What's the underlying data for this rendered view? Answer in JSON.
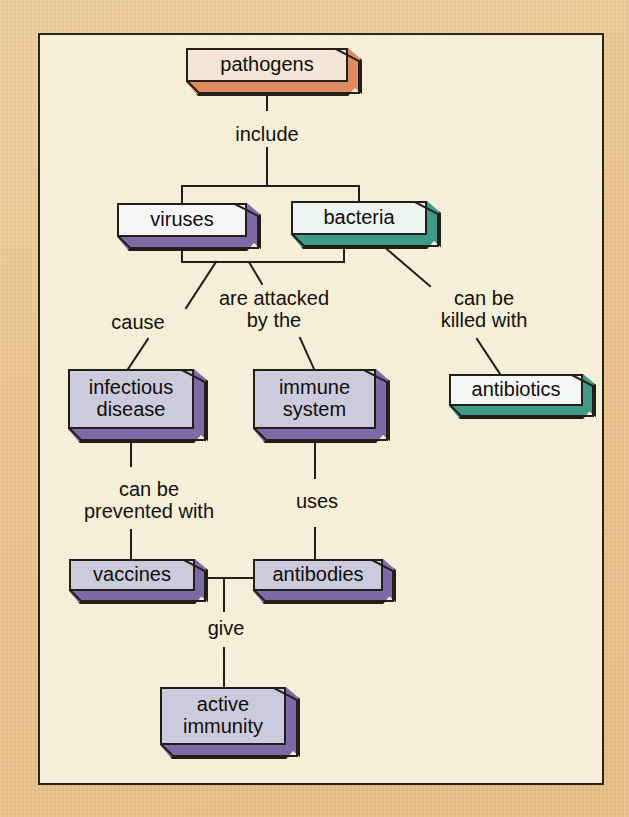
{
  "diagram": {
    "background_color": "#eec894",
    "panel_color": "#f7f1d9",
    "line_color": "#241f16"
  },
  "nodes": [
    {
      "id": "pathogens",
      "label": "pathogens",
      "x": 186,
      "y": 48,
      "w": 162,
      "h": 34,
      "depth": 12,
      "face_color": "#f3e5d8",
      "side_color": "#e08a63",
      "top_color": "#f5b494"
    },
    {
      "id": "viruses",
      "label": "viruses",
      "x": 117,
      "y": 203,
      "w": 130,
      "h": 34,
      "depth": 12,
      "face_color": "#f6f6f6",
      "side_color": "#7d6aa6",
      "top_color": "#a394c4"
    },
    {
      "id": "bacteria",
      "label": "bacteria",
      "x": 291,
      "y": 201,
      "w": 136,
      "h": 34,
      "depth": 12,
      "face_color": "#edf5f3",
      "side_color": "#3f9b88",
      "top_color": "#6dbbaa"
    },
    {
      "id": "infectious-disease",
      "label": "infectious\ndisease",
      "x": 68,
      "y": 369,
      "w": 126,
      "h": 60,
      "depth": 12,
      "face_color": "#cbcbdd",
      "side_color": "#7d6aa6",
      "top_color": "#a394c4"
    },
    {
      "id": "immune-system",
      "label": "immune\nsystem",
      "x": 253,
      "y": 369,
      "w": 123,
      "h": 60,
      "depth": 12,
      "face_color": "#cbcbdd",
      "side_color": "#7d6aa6",
      "top_color": "#a394c4"
    },
    {
      "id": "antibiotics",
      "label": "antibiotics",
      "x": 449,
      "y": 374,
      "w": 134,
      "h": 32,
      "depth": 11,
      "face_color": "#f4f7f5",
      "side_color": "#3f9b88",
      "top_color": "#6dbbaa"
    },
    {
      "id": "vaccines",
      "label": "vaccines",
      "x": 69,
      "y": 559,
      "w": 126,
      "h": 32,
      "depth": 11,
      "face_color": "#cbcbdd",
      "side_color": "#7d6aa6",
      "top_color": "#a394c4"
    },
    {
      "id": "antibodies",
      "label": "antibodies",
      "x": 253,
      "y": 559,
      "w": 130,
      "h": 32,
      "depth": 11,
      "face_color": "#cbcbdd",
      "side_color": "#7d6aa6",
      "top_color": "#a394c4"
    },
    {
      "id": "active-immunity",
      "label": "active\nimmunity",
      "x": 160,
      "y": 687,
      "w": 126,
      "h": 58,
      "depth": 12,
      "face_color": "#cbcbdd",
      "side_color": "#7d6aa6",
      "top_color": "#a394c4"
    }
  ],
  "link_labels": [
    {
      "id": "include",
      "text": "include",
      "x": 217,
      "y": 123,
      "w": 100
    },
    {
      "id": "cause",
      "text": "cause",
      "x": 88,
      "y": 311,
      "w": 100
    },
    {
      "id": "are-attacked-by-the",
      "text": "are attacked\nby the",
      "x": 199,
      "y": 287,
      "w": 150
    },
    {
      "id": "can-be-killed-with",
      "text": "can be\nkilled with",
      "x": 414,
      "y": 287,
      "w": 140
    },
    {
      "id": "can-be-prevented-with",
      "text": "can be\nprevented with",
      "x": 54,
      "y": 478,
      "w": 190
    },
    {
      "id": "uses",
      "text": "uses",
      "x": 272,
      "y": 490,
      "w": 90
    },
    {
      "id": "give",
      "text": "give",
      "x": 186,
      "y": 617,
      "w": 80
    }
  ],
  "connections": [
    {
      "id": "pathogens-to-split",
      "from": "pathogens",
      "to": "include-split"
    },
    {
      "id": "split-to-viruses",
      "from": "include-split",
      "to": "viruses"
    },
    {
      "id": "split-to-bacteria",
      "from": "include-split",
      "to": "bacteria"
    },
    {
      "id": "viruses-bacteria-bus",
      "from": "viruses",
      "to": "bacteria"
    },
    {
      "id": "bus-to-cause",
      "from": "viruses-bacteria-bus",
      "to": "infectious-disease"
    },
    {
      "id": "bus-to-immune",
      "from": "viruses-bacteria-bus",
      "to": "immune-system"
    },
    {
      "id": "bacteria-to-antibiotics",
      "from": "bacteria",
      "to": "antibiotics"
    },
    {
      "id": "infectious-to-vaccines",
      "from": "infectious-disease",
      "to": "vaccines"
    },
    {
      "id": "immune-to-antibodies",
      "from": "immune-system",
      "to": "antibodies"
    },
    {
      "id": "vaccines-to-antibodies",
      "from": "vaccines",
      "to": "antibodies"
    },
    {
      "id": "junction-to-active-immunity",
      "from": "vaccines-antibodies-junction",
      "to": "active-immunity"
    }
  ]
}
